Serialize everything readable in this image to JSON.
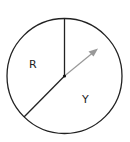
{
  "diagram": {
    "type": "spinner",
    "sections": [
      {
        "label": "R"
      },
      {
        "label": "Y"
      }
    ],
    "pointer": {
      "color": "#999999",
      "direction": "upper-right"
    },
    "colors": {
      "outline": "#222222",
      "pointer": "#999999"
    }
  }
}
